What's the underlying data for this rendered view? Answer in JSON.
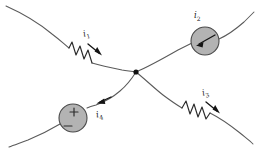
{
  "figure": {
    "background_color": "#ffffff",
    "wire_color": "#5a5a5a",
    "element_color": "#2b2b2b",
    "source_fill_color": "#b3b3b3",
    "node_color": "#111111"
  },
  "junction": {
    "name": "center-node",
    "x": 136,
    "y": 72
  },
  "branches": [
    {
      "id": "branch-1",
      "label_text": "i",
      "label_sub": "1",
      "element": "resistor",
      "position": "upper-left",
      "current_direction": "toward-junction"
    },
    {
      "id": "branch-2",
      "label_text": "i",
      "label_sub": "2",
      "element": "source",
      "position": "upper-right",
      "current_direction": "toward-junction"
    },
    {
      "id": "branch-3",
      "label_text": "i",
      "label_sub": "3",
      "element": "resistor",
      "position": "lower-right",
      "current_direction": "away-from-junction"
    },
    {
      "id": "branch-4",
      "label_text": "i",
      "label_sub": "4",
      "element": "voltage-source",
      "position": "lower-left",
      "current_direction": "away-from-junction"
    }
  ],
  "sources": {
    "current_source": {
      "name": "current-source-i2",
      "shape": "circle",
      "interior_symbol": "arrow",
      "cx": 205,
      "cy": 41,
      "r": 14
    },
    "voltage_source": {
      "name": "voltage-source-i4",
      "shape": "circle",
      "plus_symbol": "+",
      "minus_symbol": "−",
      "cx": 73,
      "cy": 118,
      "r": 14
    }
  }
}
